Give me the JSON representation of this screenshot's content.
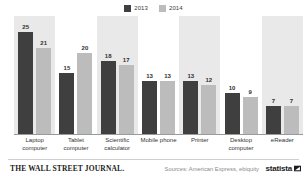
{
  "chart_data": {
    "type": "bar",
    "title": "",
    "subtitle": "",
    "xlabel": "",
    "ylabel": "",
    "ylim": [
      0,
      27
    ],
    "grid": false,
    "legend_position": "top-center",
    "categories": [
      "Laptop computer",
      "Tablet computer",
      "Scientific calculator",
      "Mobile phone",
      "Printer",
      "Desktop computer",
      "eReader"
    ],
    "series": [
      {
        "name": "2013",
        "color": "#3f3f3f",
        "values": [
          25,
          15,
          18,
          13,
          13,
          10,
          7
        ]
      },
      {
        "name": "2014",
        "color": "#bcbcbc",
        "values": [
          21,
          20,
          17,
          13,
          12,
          9,
          7
        ]
      }
    ],
    "banded_categories": [
      0,
      2,
      4,
      6
    ],
    "band_color": "#e9e9e9"
  },
  "legend": {
    "entries": [
      {
        "label": "2013",
        "color": "#3f3f3f"
      },
      {
        "label": "2014",
        "color": "#bcbcbc"
      }
    ]
  },
  "footer": {
    "wsj_logo": "THE WALL STREET JOURNAL.",
    "source": "Sources: American Express, ebiquity",
    "statista_word": "statista",
    "statista_mark": "flag-mark-icon"
  }
}
